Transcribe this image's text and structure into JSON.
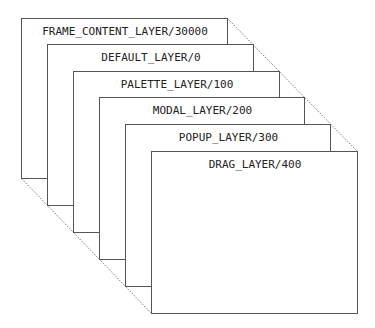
{
  "diagram": {
    "colors": {
      "background": "#ffffff",
      "box_stroke": "#555555",
      "box_fill": "#ffffff",
      "connector": "#555555",
      "text": "#222222"
    },
    "layers": [
      {
        "label": "FRAME_CONTENT_LAYER/30000",
        "x": 21,
        "y": 18,
        "w": 206,
        "h": 160
      },
      {
        "label": "DEFAULT_LAYER/0",
        "x": 47,
        "y": 44,
        "w": 206,
        "h": 161
      },
      {
        "label": "PALETTE_LAYER/100",
        "x": 73,
        "y": 71,
        "w": 206,
        "h": 161
      },
      {
        "label": "MODAL_LAYER/200",
        "x": 99,
        "y": 97,
        "w": 205,
        "h": 162
      },
      {
        "label": "POPUP_LAYER/300",
        "x": 125,
        "y": 124,
        "w": 205,
        "h": 162
      },
      {
        "label": "DRAG_LAYER/400",
        "x": 151,
        "y": 151,
        "w": 206,
        "h": 162
      }
    ]
  }
}
